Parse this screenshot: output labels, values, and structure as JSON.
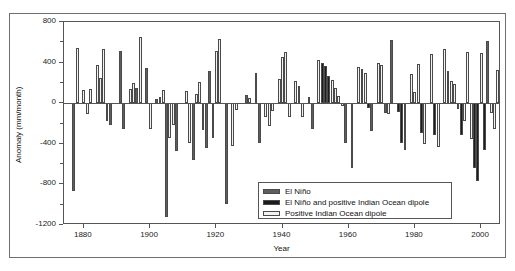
{
  "chart_data": {
    "type": "bar",
    "title": "",
    "xlabel": "Year",
    "ylabel": "Anomaly (mm/month)",
    "xlim": [
      1874,
      2006
    ],
    "ylim": [
      -1200,
      800
    ],
    "xticks": [
      1880,
      1900,
      1920,
      1940,
      1960,
      1980,
      2000
    ],
    "yticks": [
      800,
      400,
      0,
      -400,
      -800,
      -1200
    ],
    "yticks_minor": [
      600,
      200,
      -200,
      -600,
      -1000
    ],
    "grid": false,
    "legend_position": "bottom-right",
    "series": [
      {
        "name": "El Niño",
        "color": "#5e5e5e"
      },
      {
        "name": "El Niño and positive Indian Ocean dipole",
        "color": "#1c1c1c"
      },
      {
        "name": "Positive Indian Ocean dipole",
        "color": "#f2f2f2"
      }
    ],
    "bars": [
      {
        "year": 1877,
        "value": -870,
        "series": 0
      },
      {
        "year": 1878,
        "value": 540,
        "series": 2
      },
      {
        "year": 1880,
        "value": 130,
        "series": 2
      },
      {
        "year": 1881,
        "value": -105,
        "series": 2
      },
      {
        "year": 1882,
        "value": 140,
        "series": 2
      },
      {
        "year": 1884,
        "value": 380,
        "series": 2
      },
      {
        "year": 1885,
        "value": 250,
        "series": 2
      },
      {
        "year": 1886,
        "value": 530,
        "series": 2
      },
      {
        "year": 1887,
        "value": -175,
        "series": 2
      },
      {
        "year": 1888,
        "value": -215,
        "series": 0
      },
      {
        "year": 1891,
        "value": 515,
        "series": 0
      },
      {
        "year": 1892,
        "value": -250,
        "series": 0
      },
      {
        "year": 1894,
        "value": 140,
        "series": 2
      },
      {
        "year": 1895,
        "value": 200,
        "series": 2
      },
      {
        "year": 1896,
        "value": 150,
        "series": 0
      },
      {
        "year": 1897,
        "value": 650,
        "series": 2
      },
      {
        "year": 1899,
        "value": 345,
        "series": 0
      },
      {
        "year": 1900,
        "value": -250,
        "series": 2
      },
      {
        "year": 1902,
        "value": 40,
        "series": 0
      },
      {
        "year": 1903,
        "value": 60,
        "series": 2
      },
      {
        "year": 1904,
        "value": 130,
        "series": 2
      },
      {
        "year": 1905,
        "value": -1120,
        "series": 0
      },
      {
        "year": 1906,
        "value": -340,
        "series": 2
      },
      {
        "year": 1907,
        "value": -215,
        "series": 2
      },
      {
        "year": 1908,
        "value": -475,
        "series": 0
      },
      {
        "year": 1911,
        "value": 120,
        "series": 2
      },
      {
        "year": 1912,
        "value": -395,
        "series": 2
      },
      {
        "year": 1913,
        "value": -555,
        "series": 0
      },
      {
        "year": 1914,
        "value": 95,
        "series": 2
      },
      {
        "year": 1915,
        "value": 210,
        "series": 2
      },
      {
        "year": 1916,
        "value": -260,
        "series": 2
      },
      {
        "year": 1917,
        "value": -440,
        "series": 0
      },
      {
        "year": 1918,
        "value": 320,
        "series": 0
      },
      {
        "year": 1919,
        "value": -340,
        "series": 0
      },
      {
        "year": 1920,
        "value": 510,
        "series": 2
      },
      {
        "year": 1921,
        "value": 630,
        "series": 2
      },
      {
        "year": 1923,
        "value": -990,
        "series": 0
      },
      {
        "year": 1925,
        "value": -420,
        "series": 2
      },
      {
        "year": 1926,
        "value": -70,
        "series": 2
      },
      {
        "year": 1929,
        "value": 85,
        "series": 0
      },
      {
        "year": 1930,
        "value": 50,
        "series": 2
      },
      {
        "year": 1932,
        "value": 300,
        "series": 0
      },
      {
        "year": 1933,
        "value": -390,
        "series": 0
      },
      {
        "year": 1935,
        "value": -135,
        "series": 2
      },
      {
        "year": 1936,
        "value": -225,
        "series": 2
      },
      {
        "year": 1937,
        "value": -80,
        "series": 2
      },
      {
        "year": 1939,
        "value": 235,
        "series": 2
      },
      {
        "year": 1940,
        "value": 460,
        "series": 2
      },
      {
        "year": 1941,
        "value": 500,
        "series": 2
      },
      {
        "year": 1942,
        "value": -140,
        "series": 2
      },
      {
        "year": 1944,
        "value": 220,
        "series": 2
      },
      {
        "year": 1945,
        "value": 165,
        "series": 2
      },
      {
        "year": 1946,
        "value": -140,
        "series": 2
      },
      {
        "year": 1948,
        "value": 60,
        "series": 1
      },
      {
        "year": 1949,
        "value": -255,
        "series": 0
      },
      {
        "year": 1951,
        "value": 430,
        "series": 2
      },
      {
        "year": 1952,
        "value": 400,
        "series": 1
      },
      {
        "year": 1953,
        "value": 370,
        "series": 1
      },
      {
        "year": 1954,
        "value": 265,
        "series": 1
      },
      {
        "year": 1955,
        "value": 230,
        "series": 2
      },
      {
        "year": 1956,
        "value": 150,
        "series": 2
      },
      {
        "year": 1957,
        "value": 70,
        "series": 2
      },
      {
        "year": 1958,
        "value": -30,
        "series": 2
      },
      {
        "year": 1959,
        "value": -395,
        "series": 0
      },
      {
        "year": 1961,
        "value": -640,
        "series": 2
      },
      {
        "year": 1963,
        "value": 360,
        "series": 2
      },
      {
        "year": 1964,
        "value": 340,
        "series": 2
      },
      {
        "year": 1965,
        "value": 300,
        "series": 2
      },
      {
        "year": 1966,
        "value": -50,
        "series": 1
      },
      {
        "year": 1967,
        "value": -275,
        "series": 0
      },
      {
        "year": 1969,
        "value": 395,
        "series": 2
      },
      {
        "year": 1970,
        "value": 380,
        "series": 2
      },
      {
        "year": 1971,
        "value": -100,
        "series": 0
      },
      {
        "year": 1972,
        "value": -105,
        "series": 2
      },
      {
        "year": 1973,
        "value": 625,
        "series": 0
      },
      {
        "year": 1975,
        "value": -85,
        "series": 1
      },
      {
        "year": 1976,
        "value": -395,
        "series": 1
      },
      {
        "year": 1977,
        "value": -465,
        "series": 2
      },
      {
        "year": 1979,
        "value": 290,
        "series": 2
      },
      {
        "year": 1980,
        "value": 115,
        "series": 2
      },
      {
        "year": 1981,
        "value": 385,
        "series": 2
      },
      {
        "year": 1982,
        "value": -295,
        "series": 1
      },
      {
        "year": 1983,
        "value": -400,
        "series": 2
      },
      {
        "year": 1985,
        "value": 480,
        "series": 2
      },
      {
        "year": 1986,
        "value": -310,
        "series": 1
      },
      {
        "year": 1987,
        "value": -430,
        "series": 2
      },
      {
        "year": 1989,
        "value": 530,
        "series": 2
      },
      {
        "year": 1990,
        "value": 320,
        "series": 2
      },
      {
        "year": 1991,
        "value": 215,
        "series": 2
      },
      {
        "year": 1992,
        "value": 190,
        "series": 2
      },
      {
        "year": 1993,
        "value": -55,
        "series": 2
      },
      {
        "year": 1994,
        "value": -315,
        "series": 1
      },
      {
        "year": 1995,
        "value": -180,
        "series": 2
      },
      {
        "year": 1996,
        "value": 505,
        "series": 2
      },
      {
        "year": 1997,
        "value": -355,
        "series": 2
      },
      {
        "year": 1998,
        "value": -640,
        "series": 1
      },
      {
        "year": 1999,
        "value": -770,
        "series": 1
      },
      {
        "year": 2000,
        "value": 490,
        "series": 2
      },
      {
        "year": 2001,
        "value": -460,
        "series": 1
      },
      {
        "year": 2002,
        "value": 610,
        "series": 0
      },
      {
        "year": 2003,
        "value": -100,
        "series": 2
      },
      {
        "year": 2004,
        "value": -250,
        "series": 2
      },
      {
        "year": 2005,
        "value": 330,
        "series": 2
      }
    ]
  },
  "legend": {
    "items": [
      {
        "label": "El Niño"
      },
      {
        "label": "El Niño and positive Indian Ocean dipole"
      },
      {
        "label": "Positive Indian Ocean dipole"
      }
    ]
  }
}
